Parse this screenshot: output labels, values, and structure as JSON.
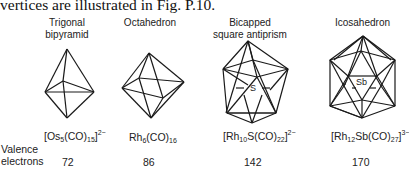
{
  "intro_text": "vertices are illustrated in Fig. P.10.",
  "row_label": {
    "line1": "Valence",
    "line2": "electrons"
  },
  "structures": [
    {
      "name_line1": "Trigonal",
      "name_line2": "bipyramid",
      "formula_pre": "[Os",
      "formula_sub1": "5",
      "formula_mid": "(CO)",
      "formula_sub2": "15",
      "formula_post": "]",
      "charge": "2−",
      "electrons": "72"
    },
    {
      "name_line1": "Octahedron",
      "name_line2": "",
      "formula_pre": "Rh",
      "formula_sub1": "6",
      "formula_mid": "(CO)",
      "formula_sub2": "16",
      "formula_post": "",
      "charge": "",
      "electrons": "86"
    },
    {
      "name_line1": "Bicapped",
      "name_line2": "square antiprism",
      "formula_pre": "[Rh",
      "formula_sub1": "10",
      "formula_mid": "S(CO)",
      "formula_sub2": "22",
      "formula_post": "]",
      "charge": "2−",
      "electrons": "142",
      "center_atom": "S"
    },
    {
      "name_line1": "Icosahedron",
      "name_line2": "",
      "formula_pre": "[Rh",
      "formula_sub1": "12",
      "formula_mid": "Sb(CO)",
      "formula_sub2": "27",
      "formula_post": "]",
      "charge": "3−",
      "electrons": "170",
      "center_atom": "Sb"
    }
  ]
}
